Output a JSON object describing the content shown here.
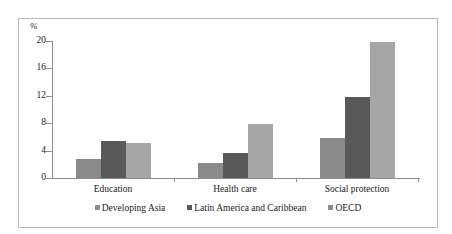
{
  "chart_data": {
    "type": "bar",
    "title": "",
    "subtitle": "",
    "xlabel": "",
    "ylabel": "%",
    "unit_label": "%",
    "categories": [
      "Education",
      "Health care",
      "Social protection"
    ],
    "series": [
      {
        "name": "Developing Asia",
        "color": "#8a8a8a",
        "values": [
          2.8,
          2.2,
          5.8
        ]
      },
      {
        "name": "Latin America and Caribbean",
        "color": "#595959",
        "values": [
          5.4,
          3.7,
          11.9
        ]
      },
      {
        "name": "OECD",
        "color": "#a6a6a6",
        "values": [
          5.1,
          7.9,
          19.8
        ]
      }
    ],
    "ylim": [
      0,
      20
    ],
    "yticks": [
      0,
      4,
      8,
      12,
      16,
      20
    ],
    "ytick_labels": [
      "0",
      "4",
      "8",
      "12",
      "16",
      "20"
    ],
    "grid": false,
    "legend_position": "bottom",
    "axis_color": "#8d8d8d",
    "frame_color": "#b9b9b9",
    "background": "#ffffff"
  },
  "figure": {
    "frame_visible": true
  }
}
